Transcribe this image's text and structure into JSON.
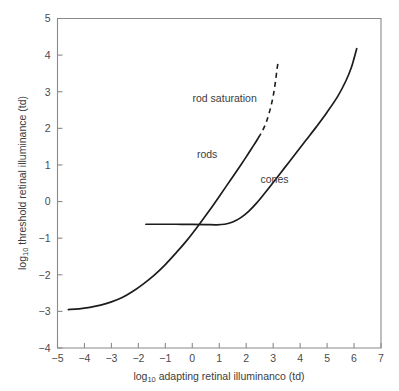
{
  "chart_data": {
    "type": "line",
    "title": "",
    "xlabel": "log10 adapting retinal illuminanco (td)",
    "ylabel": "log10 threshold retinal illuminance (td)",
    "xlim": [
      -5,
      7
    ],
    "ylim": [
      -4,
      5
    ],
    "xticks": [
      -5,
      -4,
      -3,
      -2,
      -1,
      0,
      1,
      2,
      3,
      4,
      5,
      6,
      7
    ],
    "xtick_labels": [
      "−5",
      "−4",
      "−3",
      "−2",
      "−1",
      "0",
      "1",
      "2",
      "3",
      "4",
      "5",
      "6",
      "7"
    ],
    "yticks": [
      -4,
      -3,
      -2,
      -1,
      0,
      1,
      2,
      3,
      4,
      5
    ],
    "ytick_labels": [
      "−4",
      "−3",
      "−2",
      "−1",
      "0",
      "1",
      "2",
      "3",
      "4",
      "5"
    ],
    "grid": false,
    "legend": "none",
    "series": [
      {
        "name": "rods",
        "style": "solid",
        "points": [
          [
            -4.6,
            -2.95
          ],
          [
            -4.2,
            -2.93
          ],
          [
            -3.8,
            -2.89
          ],
          [
            -3.4,
            -2.83
          ],
          [
            -3.0,
            -2.74
          ],
          [
            -2.6,
            -2.62
          ],
          [
            -2.2,
            -2.45
          ],
          [
            -1.8,
            -2.24
          ],
          [
            -1.4,
            -2.0
          ],
          [
            -1.0,
            -1.72
          ],
          [
            -0.6,
            -1.4
          ],
          [
            -0.2,
            -1.06
          ],
          [
            0.2,
            -0.68
          ],
          [
            0.6,
            -0.28
          ],
          [
            1.0,
            0.14
          ],
          [
            1.4,
            0.57
          ],
          [
            1.8,
            1.0
          ],
          [
            2.0,
            1.22
          ],
          [
            2.2,
            1.45
          ],
          [
            2.35,
            1.62
          ],
          [
            2.45,
            1.74
          ]
        ]
      },
      {
        "name": "rod saturation",
        "style": "dashed",
        "points": [
          [
            2.45,
            1.74
          ],
          [
            2.6,
            1.93
          ],
          [
            2.75,
            2.18
          ],
          [
            2.9,
            2.55
          ],
          [
            3.0,
            2.88
          ],
          [
            3.08,
            3.25
          ],
          [
            3.14,
            3.6
          ],
          [
            3.18,
            3.8
          ]
        ]
      },
      {
        "name": "cones",
        "style": "solid",
        "points": [
          [
            -1.72,
            -0.62
          ],
          [
            -1.2,
            -0.62
          ],
          [
            -0.6,
            -0.62
          ],
          [
            0.0,
            -0.625
          ],
          [
            0.5,
            -0.63
          ],
          [
            0.9,
            -0.635
          ],
          [
            1.2,
            -0.62
          ],
          [
            1.5,
            -0.56
          ],
          [
            1.8,
            -0.44
          ],
          [
            2.1,
            -0.26
          ],
          [
            2.4,
            -0.03
          ],
          [
            2.7,
            0.24
          ],
          [
            3.0,
            0.52
          ],
          [
            3.4,
            0.9
          ],
          [
            3.8,
            1.28
          ],
          [
            4.2,
            1.66
          ],
          [
            4.6,
            2.04
          ],
          [
            5.0,
            2.44
          ],
          [
            5.4,
            2.88
          ],
          [
            5.7,
            3.3
          ],
          [
            5.9,
            3.66
          ],
          [
            6.1,
            4.18
          ]
        ]
      }
    ],
    "annotations": [
      {
        "text": "rod saturation",
        "x": 1.2,
        "y": 2.72
      },
      {
        "text": "rods",
        "x": 0.55,
        "y": 1.18
      },
      {
        "text": "cones",
        "x": 3.05,
        "y": 0.52
      }
    ]
  }
}
